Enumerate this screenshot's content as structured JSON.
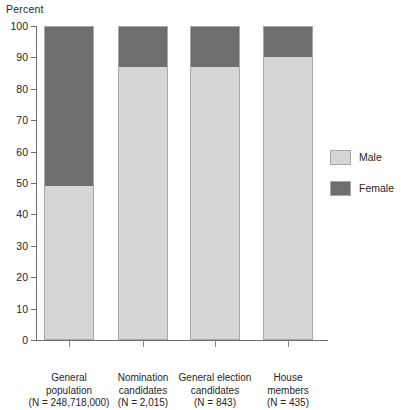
{
  "chart_data": {
    "type": "bar",
    "subtype": "stacked-100-percent",
    "title": "",
    "ylabel": "Percent",
    "xlabel": "",
    "ylim": [
      0,
      100
    ],
    "yticks": [
      0,
      10,
      20,
      30,
      40,
      50,
      60,
      70,
      80,
      90,
      100
    ],
    "grid": false,
    "legend_position": "right",
    "categories": [
      "General population",
      "Nomination candidates",
      "General election candidates",
      "House members"
    ],
    "category_lines": [
      [
        "General",
        "population",
        "(N = 248,718,000)"
      ],
      [
        "Nomination",
        "candidates",
        "(N = 2,015)"
      ],
      [
        "General election",
        "candidates",
        "(N = 843)"
      ],
      [
        "House",
        "members",
        "(N = 435)"
      ]
    ],
    "category_n_labels": [
      "(N = 248,718,000)",
      "(N = 2,015)",
      "(N = 843)",
      "(N = 435)"
    ],
    "series": [
      {
        "name": "Male",
        "color": "#d6d6d6",
        "values": [
          49,
          87,
          87,
          90
        ]
      },
      {
        "name": "Female",
        "color": "#6e6e6e",
        "values": [
          51,
          13,
          13,
          10
        ]
      }
    ]
  },
  "legend": {
    "items": [
      {
        "label": "Male",
        "color": "#d6d6d6"
      },
      {
        "label": "Female",
        "color": "#6e6e6e"
      }
    ]
  },
  "colors": {
    "male": "#d6d6d6",
    "female": "#6e6e6e",
    "axis": "#6f6f6f",
    "text": "#262626",
    "background": "#ffffff"
  }
}
